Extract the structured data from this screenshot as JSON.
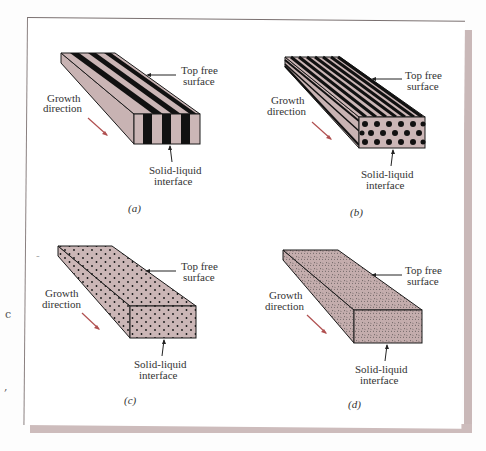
{
  "figure": {
    "panels": [
      {
        "id": "a",
        "caption": "(a)",
        "structure": "lamellar",
        "top_label": [
          "Top free",
          "surface"
        ],
        "growth_label": [
          "Growth",
          "direction"
        ],
        "interface_label": [
          "Solid-liquid",
          "interface"
        ]
      },
      {
        "id": "b",
        "caption": "(b)",
        "structure": "rod",
        "top_label": [
          "Top free",
          "surface"
        ],
        "growth_label": [
          "Growth",
          "direction"
        ],
        "interface_label": [
          "Solid-liquid",
          "interface"
        ]
      },
      {
        "id": "c",
        "caption": "(c)",
        "structure": "dispersed-particles",
        "top_label": [
          "Top free",
          "surface"
        ],
        "growth_label": [
          "Growth",
          "direction"
        ],
        "interface_label": [
          "Solid-liquid",
          "interface"
        ]
      },
      {
        "id": "d",
        "caption": "(d)",
        "structure": "fine-speckled",
        "top_label": [
          "Top free",
          "surface"
        ],
        "growth_label": [
          "Growth",
          "direction"
        ],
        "interface_label": [
          "Solid-liquid",
          "interface"
        ]
      }
    ],
    "margin_marks": [
      "c",
      "-",
      ","
    ],
    "colors": {
      "box_fill": "#cbb6b6",
      "stripe": "#111111",
      "arrow": "#b05050",
      "outline": "#1a1a1a",
      "page_shadow": "#c9b8b8"
    }
  }
}
